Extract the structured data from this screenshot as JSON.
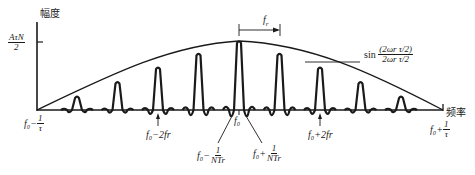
{
  "axes": {
    "y_label": "幅度",
    "x_label": "频率",
    "y_tick": {
      "num": "AτN",
      "den": "2"
    }
  },
  "annotations": {
    "spacing": "f",
    "spacing_sub": "r",
    "envelope_formula": {
      "prefix": "sin",
      "num": "(2ωr τ/2)",
      "den": "2ωr τ/2"
    },
    "left_edge": {
      "base": "f₀−",
      "num": "1",
      "den": "τ"
    },
    "right_edge": {
      "base": "f₀+",
      "num": "1",
      "den": "τ"
    },
    "minus_2fr": "f₀−2fr",
    "plus_2fr": "f₀+2fr",
    "center": "f₀",
    "null_minus": {
      "base": "f₀−",
      "num": "1",
      "den": "NTr"
    },
    "null_plus": {
      "base": "f₀+",
      "num": "1",
      "den": "NTr"
    }
  },
  "colors": {
    "ink": "#1a1a1a",
    "background": "#ffffff"
  },
  "chart_data": {
    "type": "line",
    "title": "",
    "xlabel": "频率",
    "ylabel": "幅度",
    "x_ticks": [
      "f0-1/τ",
      "f0-2fr",
      "f0-1/(NTr)",
      "f0",
      "f0+1/(NTr)",
      "f0+2fr",
      "f0+1/τ"
    ],
    "line_offsets_in_fr": [
      -4,
      -3,
      -2,
      -1,
      0,
      1,
      2,
      3,
      4
    ],
    "line_relative_heights": [
      0.2,
      0.41,
      0.62,
      0.82,
      1.0,
      0.82,
      0.62,
      0.41,
      0.2
    ],
    "y_tick": "AτN/2",
    "envelope": "sinc, zero at f0±1/τ"
  }
}
